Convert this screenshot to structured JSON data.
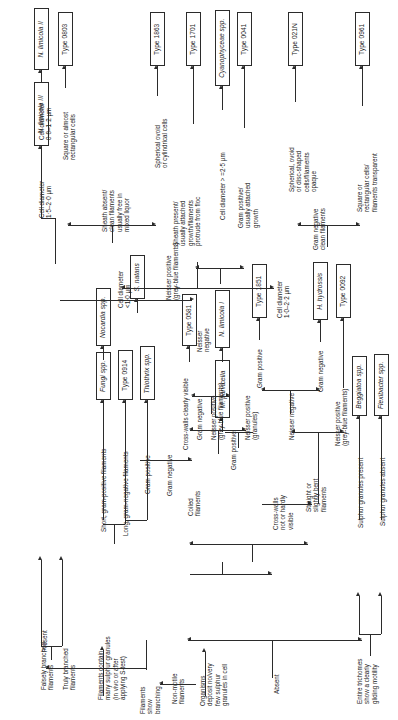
{
  "diagram": {
    "orientation": "rotated-90-ccw",
    "taxa": [
      {
        "id": "t_nlim2",
        "label": "N. limicola II",
        "italic": true
      },
      {
        "id": "t_nlim3",
        "label": "N. limicola III",
        "italic": true
      },
      {
        "id": "t_0803",
        "label": "Type 0803",
        "italic": false
      },
      {
        "id": "t_1863",
        "label": "Type 1863",
        "italic": false
      },
      {
        "id": "t_1701",
        "label": "Type 1701",
        "italic": false
      },
      {
        "id": "t_cyano",
        "label": "Cyanophyceae spp.",
        "italic": true
      },
      {
        "id": "t_0041",
        "label": "Type 0041",
        "italic": false
      },
      {
        "id": "t_021n",
        "label": "Type 021N",
        "italic": false
      },
      {
        "id": "t_0961",
        "label": "Type 0961",
        "italic": false
      },
      {
        "id": "t_snatans",
        "label": "S. natans",
        "italic": true
      },
      {
        "id": "t_nocardia",
        "label": "Nocardia spp.",
        "italic": true
      },
      {
        "id": "t_fungi",
        "label": "Fungi spp.",
        "italic": true
      },
      {
        "id": "t_0914",
        "label": "Type 0914",
        "italic": false
      },
      {
        "id": "t_thiothrix",
        "label": "Thiothrix spp.",
        "italic": true
      },
      {
        "id": "t_0581",
        "label": "Type 0581",
        "italic": false
      },
      {
        "id": "t_nlim1",
        "label": "N. limicola I",
        "italic": true
      },
      {
        "id": "t_mparv",
        "label": "M. parvicella",
        "italic": true
      },
      {
        "id": "t_1851",
        "label": "Type 1851",
        "italic": false
      },
      {
        "id": "t_hhydro",
        "label": "H. hydrossis",
        "italic": true
      },
      {
        "id": "t_0092",
        "label": "Type 0092",
        "italic": false
      },
      {
        "id": "t_beggiatoa",
        "label": "Beggiatoa spp.",
        "italic": true
      },
      {
        "id": "t_flexi",
        "label": "Flexibacter spp.",
        "italic": true
      }
    ],
    "criteria": [
      {
        "id": "c_celldiam_08",
        "text": "Cell diameter\n0·8–1·2 µm"
      },
      {
        "id": "c_celldiam_15",
        "text": "Cell diameter\n1·5–2·0 µm"
      },
      {
        "id": "c_square_rect",
        "text": "Square or almost\nrectangular cells"
      },
      {
        "id": "c_sheath_absent",
        "text": "Sheath absent/\nclean filaments\nusually free in\nmixed liquor"
      },
      {
        "id": "c_spher_ovoid",
        "text": "Spherical ovoid\nor cylindrical cells"
      },
      {
        "id": "c_sheath_present",
        "text": "Sheath present/\nusually attached\ngrowth/filaments\nprotrude from floc"
      },
      {
        "id": "c_diam_gt25",
        "text": "Cell diameter > =2·5 µm"
      },
      {
        "id": "c_gram_pos_attach",
        "text": "Gram positive/\nusually attached\ngrowth"
      },
      {
        "id": "c_spher_disc",
        "text": "Spherical, ovoid\nor disc-shaped\ncells/filaments\nopaque"
      },
      {
        "id": "c_gram_neg_clean",
        "text": "Gram negative\nclean filaments"
      },
      {
        "id": "c_square_transp",
        "text": "Square or\nrectangular cells/\nfilaments transparent"
      },
      {
        "id": "c_celldiam_lt1",
        "text": "Cell diameter\n<1·0 µm"
      },
      {
        "id": "c_celldiam_1022",
        "text": "Cell diameter\n1·0–2·2 µm"
      },
      {
        "id": "c_neisser_pos_gb",
        "text": "Neisser positive\n(grey-blue filaments)"
      },
      {
        "id": "c_neisser_neg_a",
        "text": "Neisser\nnegative"
      },
      {
        "id": "c_neisser_neg_b",
        "text": "Neisser\nnegative"
      },
      {
        "id": "c_short_grampos",
        "text": "Short, gram-positive filaments"
      },
      {
        "id": "c_long_gramneg",
        "text": "Long, gram-negative filaments"
      },
      {
        "id": "c_gram_positive_1",
        "text": "Gram positive"
      },
      {
        "id": "c_gram_negative_1",
        "text": "Gram negative"
      },
      {
        "id": "c_crosswalls_vis",
        "text": "Cross-walls clearly visible"
      },
      {
        "id": "c_gram_negative_2",
        "text": "Gram negative"
      },
      {
        "id": "c_neisser_pos_gb2",
        "text": "Neisser positive\n(grey-blue filaments)"
      },
      {
        "id": "c_gram_positive_2",
        "text": "Gram positive"
      },
      {
        "id": "c_neisser_pos_gran",
        "text": "Neisser positive\n(granules)"
      },
      {
        "id": "c_coiled",
        "text": "Coiled\nfilaments"
      },
      {
        "id": "c_gram_positive_3",
        "text": "Gram positive"
      },
      {
        "id": "c_neisser_neg_c",
        "text": "Neisser negative"
      },
      {
        "id": "c_gram_negative_3",
        "text": "Gram negative"
      },
      {
        "id": "c_neisser_pos_gb3",
        "text": "Neisser positive\n(grey-blue filaments)"
      },
      {
        "id": "c_straight_bent",
        "text": "Straight or\nslightly bent\nfilaments"
      },
      {
        "id": "c_sulphur_present",
        "text": "Sulphur granules present"
      },
      {
        "id": "c_sulphur_absent",
        "text": "Sulphur granules absent"
      },
      {
        "id": "c_crosswalls_not",
        "text": "Cross-walls\nnot or hardly\nvisible"
      },
      {
        "id": "c_falsely_branched",
        "text": "Falsely branched\nfilaments"
      },
      {
        "id": "c_truly_branched",
        "text": "Truly branched\nfilaments"
      },
      {
        "id": "c_many_sulphur",
        "text": "Filaments contain\nmany sulphur granules\n(in vivo or after\napplying S-test)"
      },
      {
        "id": "c_present",
        "text": "Present"
      },
      {
        "id": "c_branching",
        "text": "Filaments\nshow\nbranching"
      },
      {
        "id": "c_nonmotile",
        "text": "Non-motile\nfilaments"
      },
      {
        "id": "c_deposit_few",
        "text": "Organisms\ndeposit no/very\nfew sulphur\ngranules in cell"
      },
      {
        "id": "c_absent",
        "text": "Absent"
      },
      {
        "id": "c_gliding",
        "text": "Entire trichomes\nshow a clearly\ngliding motility"
      }
    ],
    "colors": {
      "line": "#2b2b2b",
      "text": "#1a1a1a",
      "background": "#ffffff"
    }
  }
}
